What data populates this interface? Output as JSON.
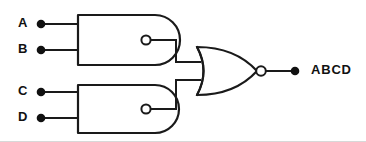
{
  "diagram": {
    "canvas": {
      "width": 366,
      "height": 142,
      "background": "#ffffff"
    },
    "stroke_color": "#1a1a1a",
    "label_color": "#111111"
  },
  "inputs": [
    {
      "id": "A",
      "label": "A",
      "dot_x": 41,
      "dot_y": 24,
      "label_x": 18,
      "label_y": 24,
      "wire_to_x": 78
    },
    {
      "id": "B",
      "label": "B",
      "dot_x": 41,
      "dot_y": 50,
      "label_x": 18,
      "label_y": 50,
      "wire_to_x": 78
    },
    {
      "id": "C",
      "label": "C",
      "dot_x": 41,
      "dot_y": 92,
      "label_x": 18,
      "label_y": 92,
      "wire_to_x": 78
    },
    {
      "id": "D",
      "label": "D",
      "dot_x": 41,
      "dot_y": 118,
      "label_x": 18,
      "label_y": 118,
      "wire_to_x": 78
    }
  ],
  "gates": [
    {
      "id": "nand-top",
      "type": "NAND",
      "shape": "and-with-bubble",
      "inputs": [
        "A",
        "B"
      ],
      "body_path": "M 78 15 L 78 65 L 155 65 A 25 25 0 0 0 155 15 Z",
      "bubble": {
        "cx": 146,
        "cy": 40,
        "r": 4.6
      },
      "output_x": 151,
      "output_y": 40
    },
    {
      "id": "nand-bottom",
      "type": "NAND",
      "shape": "and-with-bubble",
      "inputs": [
        "C",
        "D"
      ],
      "body_path": "M 78 85 L 78 133 L 155 133 A 24 24 0 0 0 155 85 Z",
      "bubble": {
        "cx": 146,
        "cy": 109,
        "r": 4.6
      },
      "output_x": 151,
      "output_y": 109
    },
    {
      "id": "nor-out",
      "type": "NOR",
      "shape": "or-with-bubble",
      "inputs": [
        "nand-top",
        "nand-bottom"
      ],
      "body_path": "M 197 47 Q 210 71 197 95 Q 235 95 257 71 Q 235 47 197 47 Z",
      "back_curve": "M 197 47 Q 210 71 197 95",
      "bubble": {
        "cx": 261,
        "cy": 71,
        "r": 4.8
      },
      "input_stub_top": {
        "x1": 189,
        "y1": 62,
        "x2": 203,
        "y2": 62
      },
      "input_stub_bottom": {
        "x1": 189,
        "y1": 80,
        "x2": 203,
        "y2": 80
      },
      "output_x": 266,
      "output_y": 71
    }
  ],
  "interconnects": [
    {
      "id": "nand-top-to-nor",
      "path": "M 151 40 L 176 40 L 176 62 L 200 62"
    },
    {
      "id": "nand-bottom-to-nor",
      "path": "M 151 109 L 176 109 L 176 80 L 200 80"
    }
  ],
  "output": {
    "id": "ABCD",
    "label": "ABCD",
    "wire_path": "M 266 71 L 293 71",
    "dot_x": 295,
    "dot_y": 71,
    "label_x": 311,
    "label_y": 71
  }
}
